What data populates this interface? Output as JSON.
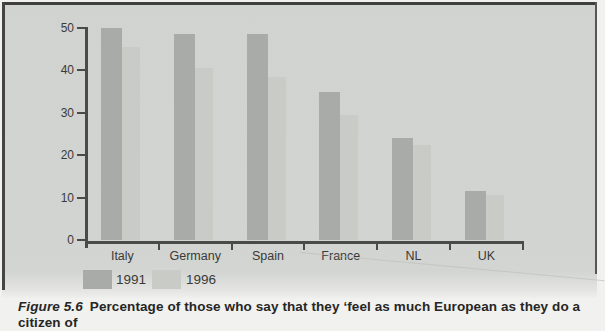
{
  "figure": {
    "caption_prefix": "Figure 5.6",
    "caption_text": "Percentage of those who say that they ‘feel as much European as they do a citizen of"
  },
  "chart_data": {
    "type": "bar",
    "categories": [
      "Italy",
      "Germany",
      "Spain",
      "France",
      "NL",
      "UK"
    ],
    "series": [
      {
        "name": "1991",
        "values": [
          50,
          48.5,
          48.5,
          35,
          24,
          11.5
        ],
        "color": "#a8aba7"
      },
      {
        "name": "1996",
        "values": [
          45.5,
          40.5,
          38.5,
          29.5,
          22.5,
          10.5
        ],
        "color": "#c9cbc7"
      }
    ],
    "title": "",
    "xlabel": "",
    "ylabel": "",
    "ylim": [
      0,
      50
    ],
    "yticks": [
      0,
      10,
      20,
      30,
      40,
      50
    ],
    "grid": false,
    "legend_position": "bottom-left"
  },
  "colors": {
    "panel_background": "#d2d4d1",
    "page_background": "#f1f1ef",
    "axis": "#4a4a48",
    "text": "#3a3a38",
    "caption_text": "#262624",
    "border": "#3f3f3d"
  }
}
